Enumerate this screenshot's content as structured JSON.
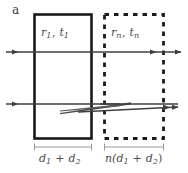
{
  "figure": {
    "panel_label": "a",
    "background_color": "#ffffff",
    "line_color": "#1a1a1a",
    "arrow_color": "#3f3f3f",
    "label_color": "#4a4a4a",
    "bracket_color": "#8a8a8a",
    "boxes": [
      {
        "name": "solid-layer-box",
        "style": "solid",
        "label_r": "r",
        "label_r_sub": "1",
        "label_t": "t",
        "label_t_sub": "1",
        "label_separator": ", ",
        "x": 34,
        "y": 14,
        "width": 58,
        "height": 125
      },
      {
        "name": "dashed-layer-box",
        "style": "dashed",
        "label_r": "r",
        "label_r_sub": "n",
        "label_t": "t",
        "label_t_sub": "n",
        "label_separator": ", ",
        "x": 104,
        "y": 14,
        "width": 60,
        "height": 125
      }
    ],
    "dimensions": [
      {
        "name": "dimension-left",
        "text_prefix": "d",
        "sub1": "1",
        "operator": " + ",
        "text_mid": "d",
        "sub2": "2",
        "bracket_x1": 34,
        "bracket_x2": 92,
        "bracket_y": 147
      },
      {
        "name": "dimension-right",
        "text_prefix": "n(d",
        "sub1": "1",
        "operator": " + ",
        "text_mid": "d",
        "sub2": "2",
        "suffix": ")",
        "bracket_x1": 104,
        "bracket_x2": 164,
        "bracket_y": 147
      }
    ],
    "rays": [
      {
        "name": "incident-ray-top",
        "y": 52,
        "x1": 6,
        "x2": 182,
        "direction": "right"
      },
      {
        "name": "incident-ray-lower",
        "y": 104,
        "x1": 6,
        "x2": 182,
        "direction": "right"
      },
      {
        "name": "converging-beam-wedge-upper",
        "y": 104,
        "x1": 60,
        "x2": 130
      },
      {
        "name": "converging-beam-wedge-lower",
        "y": 110,
        "x1": 60,
        "x2": 130
      }
    ]
  }
}
